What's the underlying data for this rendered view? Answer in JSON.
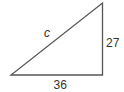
{
  "diagram": {
    "type": "right-triangle",
    "labels": {
      "hypotenuse": "c",
      "vertical_leg": "27",
      "horizontal_leg": "36"
    },
    "stroke_color": "#555555",
    "text_color": "#333333"
  }
}
